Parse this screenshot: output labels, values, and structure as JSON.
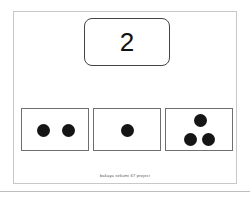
{
  "prompt": {
    "number": "2"
  },
  "options": [
    {
      "id": "option-two-dots",
      "dot_count": 2
    },
    {
      "id": "option-one-dot",
      "dot_count": 1
    },
    {
      "id": "option-three-dots",
      "dot_count": 3
    }
  ],
  "footer": {
    "text": "bakaya sekumi 67 project"
  },
  "colors": {
    "dot": "#151515",
    "border": "#6f6f6f",
    "frame": "#c8c8c8"
  }
}
